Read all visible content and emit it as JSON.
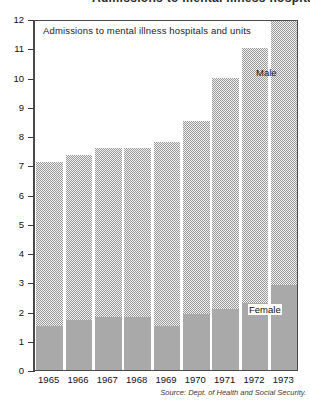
{
  "page": {
    "clipped_header_text": "Admissions to mental illness hospitals and units"
  },
  "figure": {
    "title": "Admissions to mental illness hospitals and units",
    "source_note": "Source: Dept. of Health and Social Security.",
    "series_labels": {
      "male": "Male",
      "female": "Female"
    }
  },
  "chart_data": {
    "type": "bar",
    "stacked": true,
    "title": "Admissions to mental illness hospitals and units",
    "xlabel": "",
    "ylabel": "",
    "ylim": [
      0,
      12
    ],
    "yticks": [
      0,
      1,
      2,
      3,
      4,
      5,
      6,
      7,
      8,
      9,
      10,
      11,
      12
    ],
    "ytick_labels": [
      "0",
      "1",
      "2",
      "3",
      "4",
      "5",
      "6",
      "7",
      "8",
      "9",
      "10",
      "11",
      "12"
    ],
    "grid": false,
    "legend_position": "inline-annotation",
    "categories": [
      "1965",
      "1966",
      "1967",
      "1968",
      "1969",
      "1970",
      "1971",
      "1972",
      "1973"
    ],
    "series": [
      {
        "name": "Female",
        "color": "#a9a9a9",
        "fill": "solid",
        "values": [
          1.5,
          1.7,
          1.8,
          1.8,
          1.5,
          1.9,
          2.1,
          2.3,
          2.9
        ]
      },
      {
        "name": "Male",
        "color": "#f0f0f0",
        "fill": "dotted",
        "values": [
          5.6,
          5.65,
          5.8,
          5.8,
          6.3,
          6.6,
          7.9,
          8.7,
          9.1
        ]
      }
    ],
    "totals": [
      7.1,
      7.35,
      7.6,
      7.6,
      7.8,
      8.5,
      10.0,
      11.0,
      12.0
    ],
    "annotations": [
      {
        "text": "Male",
        "x": "1972",
        "y": 10.2
      },
      {
        "text": "Female",
        "x": "1972",
        "y": 2.1
      }
    ]
  },
  "colors": {
    "male_fill": "#f0f0f0",
    "male_dot": "#9a9a9a",
    "female_fill": "#a9a9a9",
    "axis": "#4a4a4a",
    "background": "#ffffff",
    "text": "#1a1a1a"
  }
}
